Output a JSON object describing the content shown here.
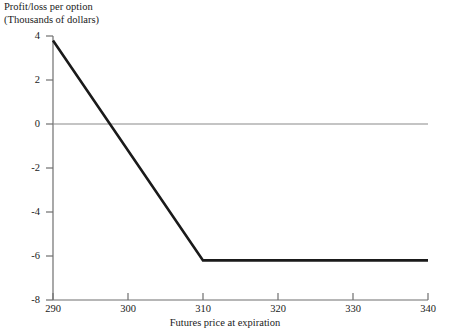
{
  "chart_data": {
    "type": "line",
    "title": "Profit/loss per option (Thousands of dollars)",
    "title_lines": [
      "Profit/loss per option",
      "(Thousands of dollars)"
    ],
    "xlabel": "Futures price at expiration",
    "ylabel": "Profit/loss per option (Thousands of dollars)",
    "xlim": [
      290,
      340
    ],
    "ylim": [
      -8,
      4
    ],
    "xticks": [
      290,
      300,
      310,
      320,
      330,
      340
    ],
    "xtick_labels": [
      "290",
      "300",
      "310",
      "320",
      "330",
      "340"
    ],
    "yticks": [
      4,
      2,
      0,
      -2,
      -4,
      -6,
      -8
    ],
    "ytick_labels": [
      "4",
      "2",
      "0",
      "-2",
      "-4",
      "-6",
      "-8"
    ],
    "grid": false,
    "legend": null,
    "zero_reference_line": 0,
    "series": [
      {
        "name": "Profit/loss per option",
        "color": "#1a1a1a",
        "x": [
          290,
          310,
          340
        ],
        "values": [
          3.8,
          -6.2,
          -6.2
        ],
        "breakeven_x": 297,
        "kink_x": 310,
        "plateau_value": -6.2
      }
    ]
  },
  "axes": {
    "x_axis_name": "futures-price-axis",
    "y_axis_name": "profit-loss-axis"
  },
  "colors": {
    "line": "#1a1a1a",
    "axis": "#6f6f6f",
    "zero_line": "#8a8a8a",
    "background": "#ffffff",
    "text": "#1a1a1a"
  }
}
